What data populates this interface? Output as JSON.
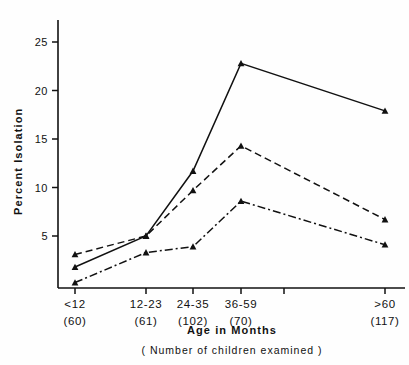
{
  "chart_data": {
    "type": "line",
    "title": "",
    "xlabel": "Age in Months",
    "xlabel_sub": "( Number of children examined )",
    "ylabel": "Percent Isolation",
    "ylim": [
      0,
      27
    ],
    "ytick_values": [
      5,
      10,
      15,
      20,
      25
    ],
    "ytick_labels": [
      "5",
      "10",
      "15",
      "20",
      "25"
    ],
    "grid": false,
    "legend": "none",
    "categories": [
      "<12",
      "12-23",
      "24-35",
      "36-59",
      ">60"
    ],
    "category_counts": [
      "(60)",
      "(61)",
      "(102)",
      "(70)",
      "(117)"
    ],
    "category_x_px": [
      75,
      146,
      193,
      241,
      385
    ],
    "extra_unlabeled_ticks_px": [
      284
    ],
    "series": [
      {
        "name": "solid-triangle-series",
        "line_style": "solid",
        "marker": "triangle",
        "color": "#111111",
        "values": [
          1.8,
          5.0,
          11.7,
          22.8,
          17.9
        ]
      },
      {
        "name": "dashed-triangle-series",
        "line_style": "dashed",
        "marker": "triangle",
        "color": "#111111",
        "values": [
          3.1,
          5.0,
          9.7,
          14.3,
          6.7
        ]
      },
      {
        "name": "dashdot-triangle-series",
        "line_style": "dashdot",
        "marker": "triangle",
        "color": "#111111",
        "values": [
          0.2,
          3.3,
          3.9,
          8.6,
          4.1
        ]
      }
    ]
  },
  "axes": {
    "y_axis_name": "Percent Isolation",
    "x_axis_name": "Age in Months"
  },
  "colors": {
    "ink": "#111111",
    "background": "#fefefe"
  }
}
